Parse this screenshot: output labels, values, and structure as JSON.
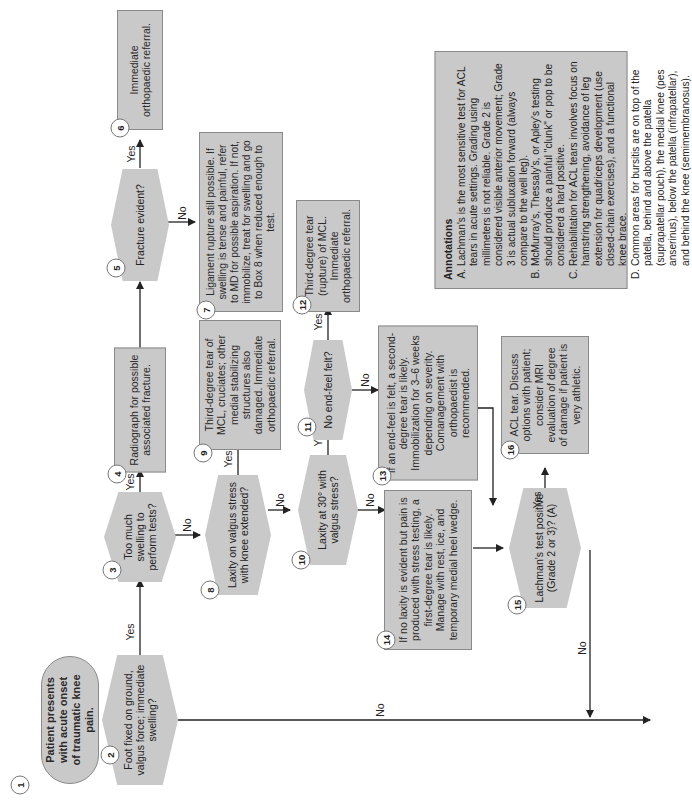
{
  "diagram": {
    "nodes": [
      {
        "id": "1",
        "type": "start",
        "text": "Patient presents with acute onset of traumatic knee pain."
      },
      {
        "id": "2",
        "type": "decision",
        "text": "Foot fixed on ground, valgus force; immediate swelling?"
      },
      {
        "id": "3",
        "type": "decision",
        "text": "Too much swelling to perform tests?"
      },
      {
        "id": "4",
        "type": "action",
        "text": "Radiograph for possible associated fracture."
      },
      {
        "id": "5",
        "type": "decision",
        "text": "Fracture evident?"
      },
      {
        "id": "6",
        "type": "action",
        "text": "Immediate orthopaedic referral."
      },
      {
        "id": "7",
        "type": "action",
        "text": "Ligament rupture still possible. If swelling is tense and painful, refer to MD for possible aspiration. If not, immobilize, treat for swelling and go to Box 8 when reduced enough to test."
      },
      {
        "id": "8",
        "type": "decision",
        "text": "Laxity on valgus stress with knee extended?"
      },
      {
        "id": "9",
        "type": "action",
        "text": "Third-degree tear of MCL, cruciates; other medial stabilizing structures also damaged. Immediate orthopaedic referral."
      },
      {
        "id": "10",
        "type": "decision",
        "text": "Laxity at 30° with valgus stress?"
      },
      {
        "id": "11",
        "type": "decision",
        "text": "No end-feel felt?"
      },
      {
        "id": "12",
        "type": "action",
        "text": "Third-degree tear (rupture) of MCL. Immediate orthopaedic referral."
      },
      {
        "id": "13",
        "type": "action",
        "text": "If an end-feel is felt, a second-degree tear is likely. Immobilization for 3–6 weeks depending on severity. Comanagement with orthopaedist is recommended."
      },
      {
        "id": "14",
        "type": "action",
        "text": "If no laxity is evident but pain is produced with stress testing, a first-degree tear is likely. Manage with rest, ice, and temporary medial heel wedge."
      },
      {
        "id": "15",
        "type": "decision",
        "text": "Lachman's test positive (Grade 2 or 3)? (A)"
      },
      {
        "id": "16",
        "type": "action",
        "text": "ACL tear. Discuss options with patient; consider MRI evaluation of degree of damage if patient is very athletic."
      }
    ],
    "edge_labels": {
      "yes": "Yes",
      "no": "No"
    },
    "annotations": {
      "heading": "Annotations",
      "items": [
        "Lachman's is the most sensitive test for ACL tears in acute settings. Grading using millimeters is not reliable. Grade 2 is considered visible anterior movement; Grade 3 is actual subluxation forward (always compare to the well leg).",
        "McMurray's, Thessaly's, or Apley's testing should produce a painful \"clunk\" or pop to be considered a hard positive.",
        "Rehabilitation for ACL tears involves focus on hamstring strengthening, avoidance of leg extension for quadriceps development (use closed-chain exercises), and a functional knee brace.",
        "Common areas for bursitis are on top of the patella, behind and above the patella (suprapatellar pouch), the medial knee (pes anserinus), below the patella (infrapatellar), and behind the knee (semimembranosus)."
      ]
    },
    "colors": {
      "box_fill": "#c9c9c9",
      "box_border": "#8a8a8a",
      "line": "#222222",
      "background": "#ffffff"
    }
  }
}
